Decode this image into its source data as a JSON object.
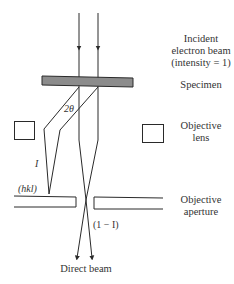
{
  "diagram": {
    "type": "electron-diffraction-bright-field-schematic",
    "labels": {
      "incident_beam": [
        "Incident",
        "electron beam",
        "(intensity = 1)"
      ],
      "specimen": "Specimen",
      "objective_lens": [
        "Objective",
        "lens"
      ],
      "objective_aperture": [
        "Objective",
        "aperture"
      ],
      "direct_beam": "Direct beam",
      "angle": "2θ",
      "diffracted_intensity": "I",
      "reflection": "(hkl)",
      "transmitted_intensity": "(1 − I)"
    },
    "colors": {
      "line": "#2a2a2a",
      "specimen_fill": "#8c8c8c",
      "background": "#ffffff"
    }
  }
}
